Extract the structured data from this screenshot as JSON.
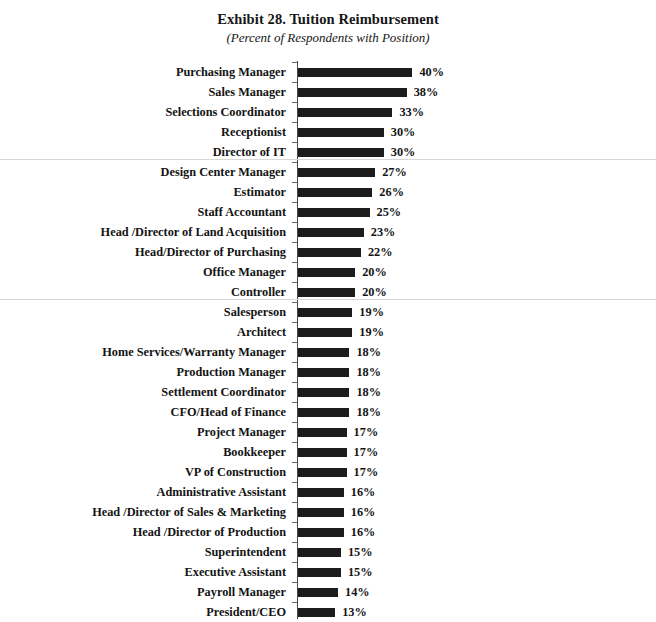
{
  "chart_data": {
    "type": "bar",
    "orientation": "horizontal",
    "title": "Exhibit 28. Tuition Reimbursement",
    "subtitle": "(Percent of Respondents with Position)",
    "xlabel": "",
    "ylabel": "",
    "xlim": [
      0,
      40
    ],
    "grid": false,
    "legend": null,
    "value_suffix": "%",
    "bar_color": "#1c1c1c",
    "separator_color": "#d8d8d8",
    "axis_color": "#4a4a4a",
    "categories": [
      "Purchasing Manager",
      "Sales Manager",
      "Selections Coordinator",
      "Receptionist",
      "Director of IT",
      "Design Center Manager",
      "Estimator",
      "Staff Accountant",
      "Head /Director of Land Acquisition",
      "Head/Director of Purchasing",
      "Office Manager",
      "Controller",
      "Salesperson",
      "Architect",
      "Home Services/Warranty Manager",
      "Production Manager",
      "Settlement Coordinator",
      "CFO/Head of Finance",
      "Project Manager",
      "Bookkeeper",
      "VP of Construction",
      "Administrative Assistant",
      "Head /Director of Sales & Marketing",
      "Head /Director of Production",
      "Superintendent",
      "Executive Assistant",
      "Payroll Manager",
      "President/CEO"
    ],
    "values": [
      40,
      38,
      33,
      30,
      30,
      27,
      26,
      25,
      23,
      22,
      20,
      20,
      19,
      19,
      18,
      18,
      18,
      18,
      17,
      17,
      17,
      16,
      16,
      16,
      15,
      15,
      14,
      13
    ],
    "value_labels": [
      "40%",
      "38%",
      "33%",
      "30%",
      "30%",
      "27%",
      "26%",
      "25%",
      "23%",
      "22%",
      "20%",
      "20%",
      "19%",
      "19%",
      "18%",
      "18%",
      "18%",
      "18%",
      "17%",
      "17%",
      "17%",
      "16%",
      "16%",
      "16%",
      "15%",
      "15%",
      "14%",
      "13%"
    ],
    "group_breaks_after_index": [
      4,
      11
    ]
  }
}
